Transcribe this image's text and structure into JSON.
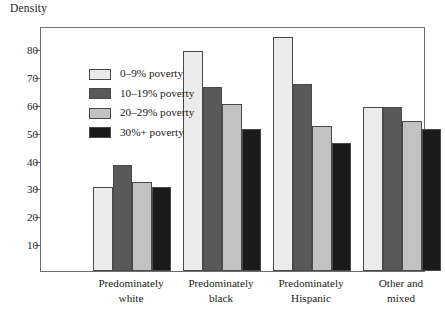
{
  "chart_data": {
    "type": "bar",
    "title": "",
    "ylabel": "Density",
    "xlabel": "",
    "ylim": [
      0,
      88
    ],
    "yticks": [
      10,
      20,
      30,
      40,
      50,
      60,
      70,
      80
    ],
    "grid": false,
    "legend_position": "top-left inside plot",
    "categories": [
      "Predominately white",
      "Predominately black",
      "Predominately Hispanic",
      "Other and mixed"
    ],
    "category_lines": [
      [
        "Predominately",
        "white"
      ],
      [
        "Predominately",
        "black"
      ],
      [
        "Predominately",
        "Hispanic"
      ],
      [
        "Other and",
        "mixed"
      ]
    ],
    "series": [
      {
        "name": "0–9% poverty",
        "color": "#ebebeb",
        "values": [
          30,
          79,
          84,
          59
        ]
      },
      {
        "name": "10–19% poverty",
        "color": "#595959",
        "values": [
          38,
          66,
          67,
          59
        ]
      },
      {
        "name": "20–29% poverty",
        "color": "#c2c2c2",
        "values": [
          32,
          60,
          52,
          54
        ]
      },
      {
        "name": "30%+ poverty",
        "color": "#1a1a1a",
        "values": [
          30,
          51,
          46,
          51
        ]
      }
    ]
  },
  "axis": {
    "y_title": "Density",
    "y_tick_labels": [
      "80",
      "70",
      "60",
      "50",
      "40",
      "30",
      "20",
      "10"
    ]
  },
  "legend": {
    "items": [
      {
        "label": "0–9% poverty"
      },
      {
        "label": "10–19% poverty"
      },
      {
        "label": "20–29% poverty"
      },
      {
        "label": "30%+ poverty"
      }
    ]
  },
  "colors": {
    "frame": "#6e6e6e",
    "bar_outline": "#4a4a4a",
    "text": "#1a1a1a",
    "background": "#ffffff"
  }
}
